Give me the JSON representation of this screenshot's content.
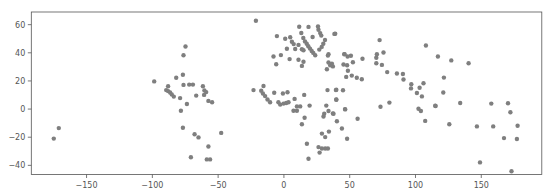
{
  "chart_data": {
    "type": "scatter",
    "title": "",
    "xlabel": "",
    "ylabel": "",
    "xlim": [
      -192,
      196
    ],
    "ylim": [
      -46.5,
      69
    ],
    "grid": false,
    "legend": null,
    "marker_color": "#7f7f7f",
    "xticks": [
      -150,
      -100,
      -50,
      0,
      50,
      100,
      150
    ],
    "xtick_labels": [
      "−150",
      "−100",
      "−50",
      "0",
      "50",
      "100",
      "150"
    ],
    "yticks": [
      -40,
      -20,
      0,
      20,
      40,
      60
    ],
    "ytick_labels": [
      "−40",
      "−20",
      "0",
      "20",
      "40",
      "60"
    ],
    "points": [
      [
        -171.1,
        -13.5
      ],
      [
        -174.9,
        -21.0
      ],
      [
        -74.8,
        44.5
      ],
      [
        -76.3,
        38.2
      ],
      [
        -81.9,
        22.2
      ],
      [
        -76.8,
        24.4
      ],
      [
        -98.6,
        19.7
      ],
      [
        -76.3,
        17.2
      ],
      [
        -72.0,
        17.4
      ],
      [
        -69.2,
        17.4
      ],
      [
        -88.0,
        16.2
      ],
      [
        -89.5,
        13.5
      ],
      [
        -88.0,
        12.8
      ],
      [
        -86.5,
        11.8
      ],
      [
        -85.2,
        10.4
      ],
      [
        -83.7,
        8.9
      ],
      [
        -61.6,
        16.2
      ],
      [
        -60.4,
        13.3
      ],
      [
        -59.1,
        12.1
      ],
      [
        -60.7,
        10.1
      ],
      [
        -66.7,
        9.6
      ],
      [
        -78.9,
        7.8
      ],
      [
        -57.4,
        5.8
      ],
      [
        -54.6,
        4.8
      ],
      [
        -73.7,
        3.6
      ],
      [
        -78.3,
        -1.2
      ],
      [
        -76.8,
        -13.3
      ],
      [
        -47.7,
        -16.9
      ],
      [
        -67.9,
        -17.9
      ],
      [
        -64.9,
        -20.1
      ],
      [
        -57.4,
        -26.6
      ],
      [
        -70.7,
        -34.3
      ],
      [
        -58.6,
        -35.8
      ],
      [
        -56.1,
        -35.8
      ],
      [
        -21.3,
        62.8
      ],
      [
        11.6,
        58.5
      ],
      [
        18.7,
        58.4
      ],
      [
        25.9,
        58.7
      ],
      [
        26.3,
        56.4
      ],
      [
        27.6,
        54.0
      ],
      [
        28.4,
        52.2
      ],
      [
        13.2,
        54.1
      ],
      [
        39.0,
        53.6
      ],
      [
        -5.3,
        51.9
      ],
      [
        1.0,
        50.0
      ],
      [
        4.8,
        51.0
      ],
      [
        6.1,
        47.9
      ],
      [
        7.4,
        46.2
      ],
      [
        14.7,
        50.5
      ],
      [
        16.0,
        48.1
      ],
      [
        17.3,
        46.5
      ],
      [
        18.5,
        44.7
      ],
      [
        19.8,
        43.0
      ],
      [
        21.1,
        41.3
      ],
      [
        22.3,
        39.9
      ],
      [
        21.8,
        51.2
      ],
      [
        31.2,
        49.1
      ],
      [
        29.9,
        46.5
      ],
      [
        28.7,
        44.2
      ],
      [
        26.9,
        42.3
      ],
      [
        11.1,
        45.6
      ],
      [
        13.7,
        42.5
      ],
      [
        14.9,
        41.8
      ],
      [
        2.3,
        42.9
      ],
      [
        8.6,
        42.7
      ],
      [
        -2.3,
        38.4
      ],
      [
        -7.9,
        37.4
      ],
      [
        4.3,
        35.5
      ],
      [
        11.1,
        35.1
      ],
      [
        14.9,
        33.6
      ],
      [
        13.7,
        30.7
      ],
      [
        -5.9,
        31.9
      ],
      [
        23.8,
        38.2
      ],
      [
        33.9,
        38.9
      ],
      [
        33.4,
        38.0
      ],
      [
        33.9,
        33.1
      ],
      [
        35.2,
        31.2
      ],
      [
        37.2,
        30.3
      ],
      [
        46.1,
        39.1
      ],
      [
        48.4,
        37.4
      ],
      [
        32.7,
        28.3
      ],
      [
        48.0,
        31.2
      ],
      [
        38.4,
        53.4
      ],
      [
        72.7,
        49.0
      ],
      [
        107.9,
        45.2
      ],
      [
        117.0,
        37.4
      ],
      [
        45.8,
        38.9
      ],
      [
        50.9,
        37.9
      ],
      [
        59.7,
        35.8
      ],
      [
        70.7,
        38.9
      ],
      [
        70.2,
        36.5
      ],
      [
        75.7,
        40.2
      ],
      [
        36.5,
        32.2
      ],
      [
        45.3,
        31.7
      ],
      [
        52.4,
        33.3
      ],
      [
        70.2,
        32.6
      ],
      [
        74.5,
        31.4
      ],
      [
        48.6,
        27.3
      ],
      [
        78.5,
        26.3
      ],
      [
        85.9,
        25.3
      ],
      [
        90.4,
        24.9
      ],
      [
        90.9,
        21.0
      ],
      [
        47.3,
        22.9
      ],
      [
        51.6,
        23.8
      ],
      [
        55.4,
        22.2
      ],
      [
        59.2,
        21.2
      ],
      [
        96.8,
        17.7
      ],
      [
        96.6,
        14.7
      ],
      [
        103.1,
        15.2
      ],
      [
        106.1,
        18.4
      ],
      [
        101.1,
        11.4
      ],
      [
        104.9,
        9.0
      ],
      [
        39.8,
        13.7
      ],
      [
        44.9,
        13.4
      ],
      [
        39.8,
        6.8
      ],
      [
        80.2,
        4.6
      ],
      [
        73.4,
        1.7
      ],
      [
        102.3,
        0.3
      ],
      [
        104.1,
        -1.4
      ],
      [
        115.3,
        2.2
      ],
      [
        46.6,
        -0.2
      ],
      [
        37.2,
        -3.1
      ],
      [
        56.0,
        -6.9
      ],
      [
        -23.1,
        13.5
      ],
      [
        -15.5,
        16.4
      ],
      [
        -17.3,
        13.0
      ],
      [
        -16.0,
        11.1
      ],
      [
        -14.3,
        9.2
      ],
      [
        -12.5,
        6.8
      ],
      [
        -10.5,
        4.9
      ],
      [
        -7.4,
        11.6
      ],
      [
        -0.8,
        11.1
      ],
      [
        2.7,
        12.0
      ],
      [
        -4.2,
        4.9
      ],
      [
        -2.8,
        3.2
      ],
      [
        -0.3,
        3.9
      ],
      [
        1.7,
        4.3
      ],
      [
        3.5,
        4.9
      ],
      [
        8.1,
        7.2
      ],
      [
        15.4,
        10.1
      ],
      [
        9.9,
        1.9
      ],
      [
        12.4,
        1.9
      ],
      [
        7.3,
        -1.2
      ],
      [
        9.9,
        -1.2
      ],
      [
        19.5,
        2.5
      ],
      [
        15.7,
        -6.2
      ],
      [
        13.7,
        -10.8
      ],
      [
        33.1,
        13.5
      ],
      [
        39.5,
        13.5
      ],
      [
        39.8,
        6.7
      ],
      [
        32.2,
        2.5
      ],
      [
        46.4,
        0.0
      ],
      [
        33.9,
        -1.4
      ],
      [
        30.6,
        -3.3
      ],
      [
        30.1,
        -5.3
      ],
      [
        37.7,
        -3.3
      ],
      [
        40.3,
        -8.7
      ],
      [
        44.1,
        -13.8
      ],
      [
        34.2,
        -16.0
      ],
      [
        28.9,
        -17.4
      ],
      [
        31.4,
        -19.9
      ],
      [
        48.0,
        -21.1
      ],
      [
        17.5,
        -24.6
      ],
      [
        26.3,
        -27.0
      ],
      [
        28.9,
        -28.0
      ],
      [
        31.4,
        -28.0
      ],
      [
        33.4,
        -28.0
      ],
      [
        27.1,
        -30.9
      ],
      [
        18.7,
        -35.3
      ],
      [
        127.2,
        34.6
      ],
      [
        140.4,
        32.6
      ],
      [
        121.6,
        22.4
      ],
      [
        121.1,
        11.8
      ],
      [
        115.0,
        2.4
      ],
      [
        134.0,
        4.3
      ],
      [
        107.4,
        -8.4
      ],
      [
        125.7,
        -10.8
      ],
      [
        157.6,
        3.9
      ],
      [
        170.3,
        4.1
      ],
      [
        172.1,
        -2.2
      ],
      [
        146.7,
        -12.3
      ],
      [
        159.1,
        -12.3
      ],
      [
        177.6,
        -11.8
      ],
      [
        167.3,
        -20.6
      ],
      [
        177.1,
        -21.3
      ],
      [
        149.0,
        -37.9
      ],
      [
        173.0,
        -44.2
      ]
    ]
  }
}
